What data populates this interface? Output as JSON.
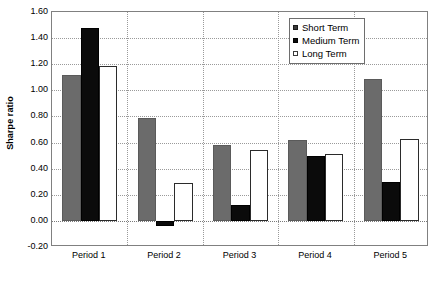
{
  "chart_data": {
    "type": "bar",
    "title": "",
    "xlabel": "",
    "ylabel": "Sharpe ratio",
    "categories": [
      "Period 1",
      "Period 2",
      "Period 3",
      "Period 4",
      "Period 5"
    ],
    "series": [
      {
        "name": "Short Term",
        "color": "#6b6b6b",
        "values": [
          1.12,
          0.79,
          0.58,
          0.62,
          1.09
        ]
      },
      {
        "name": "Medium Term",
        "color": "#0b0b0b",
        "values": [
          1.48,
          -0.04,
          0.12,
          0.5,
          0.3
        ]
      },
      {
        "name": "Long Term",
        "color": "#ffffff",
        "values": [
          1.19,
          0.29,
          0.54,
          0.51,
          0.63
        ]
      }
    ],
    "ylim": [
      -0.2,
      1.6
    ],
    "ytick_step": 0.2,
    "yticks": [
      "1.60",
      "1.40",
      "1.20",
      "1.00",
      "0.80",
      "0.60",
      "0.40",
      "0.20",
      "0.00",
      "-0.20"
    ],
    "grid": "horizontal-dotted-and-vertical-category-dividers",
    "legend_position": "top-right-inside"
  },
  "legend": {
    "items": [
      {
        "label": "Short Term",
        "swatch": "short"
      },
      {
        "label": "Medium Term",
        "swatch": "medium"
      },
      {
        "label": "Long Term",
        "swatch": "long"
      }
    ]
  }
}
